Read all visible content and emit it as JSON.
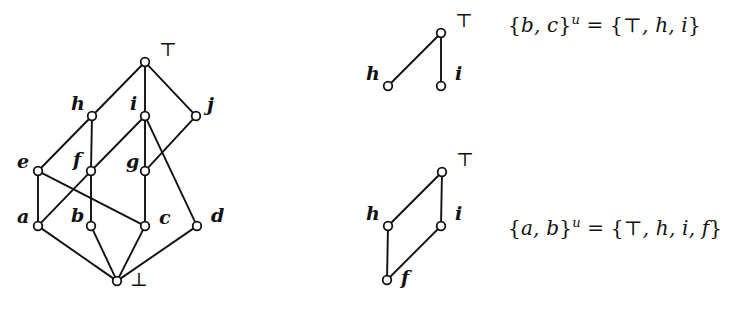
{
  "figure": {
    "background": "#ffffff",
    "ink": "#111111"
  },
  "main_lattice": {
    "name": "main-lattice",
    "nodes": [
      {
        "id": "top",
        "label": "⊤",
        "label_style": "upright",
        "x": 145,
        "y": 62,
        "lx": 159,
        "ly": 40
      },
      {
        "id": "h",
        "label": "h",
        "label_style": "italic",
        "x": 92,
        "y": 116,
        "lx": 71,
        "ly": 94
      },
      {
        "id": "i",
        "label": "i",
        "label_style": "italic",
        "x": 145,
        "y": 116,
        "lx": 130,
        "ly": 94
      },
      {
        "id": "j",
        "label": "j",
        "label_style": "italic",
        "x": 196,
        "y": 116,
        "lx": 207,
        "ly": 95
      },
      {
        "id": "e",
        "label": "e",
        "label_style": "italic",
        "x": 38,
        "y": 171,
        "lx": 17,
        "ly": 152
      },
      {
        "id": "f",
        "label": "f",
        "label_style": "italic",
        "x": 91,
        "y": 171,
        "lx": 73,
        "ly": 150
      },
      {
        "id": "g",
        "label": "g",
        "label_style": "italic",
        "x": 145,
        "y": 171,
        "lx": 126,
        "ly": 152
      },
      {
        "id": "a",
        "label": "a",
        "label_style": "italic",
        "x": 38,
        "y": 226,
        "lx": 17,
        "ly": 207
      },
      {
        "id": "b",
        "label": "b",
        "label_style": "italic",
        "x": 91,
        "y": 226,
        "lx": 71,
        "ly": 206
      },
      {
        "id": "c",
        "label": "c",
        "label_style": "italic",
        "x": 145,
        "y": 226,
        "lx": 159,
        "ly": 208
      },
      {
        "id": "d",
        "label": "d",
        "label_style": "italic",
        "x": 197,
        "y": 226,
        "lx": 211,
        "ly": 206
      },
      {
        "id": "bot",
        "label": "⊥",
        "label_style": "upright",
        "x": 117,
        "y": 281,
        "lx": 130,
        "ly": 270
      }
    ],
    "edges": [
      [
        "top",
        "h"
      ],
      [
        "top",
        "i"
      ],
      [
        "top",
        "j"
      ],
      [
        "h",
        "e"
      ],
      [
        "h",
        "f"
      ],
      [
        "i",
        "f"
      ],
      [
        "i",
        "g"
      ],
      [
        "i",
        "d"
      ],
      [
        "j",
        "g"
      ],
      [
        "e",
        "a"
      ],
      [
        "e",
        "c"
      ],
      [
        "f",
        "a"
      ],
      [
        "f",
        "b"
      ],
      [
        "g",
        "c"
      ],
      [
        "a",
        "bot"
      ],
      [
        "b",
        "bot"
      ],
      [
        "c",
        "bot"
      ],
      [
        "d",
        "bot"
      ]
    ]
  },
  "sub_lattice_1": {
    "name": "upper-bound-lattice-bc",
    "nodes": [
      {
        "id": "t1",
        "label": "⊤",
        "label_style": "upright",
        "x": 441,
        "y": 33,
        "lx": 455,
        "ly": 11
      },
      {
        "id": "h1",
        "label": "h",
        "label_style": "italic",
        "x": 388,
        "y": 86,
        "lx": 366,
        "ly": 64
      },
      {
        "id": "i1",
        "label": "i",
        "label_style": "italic",
        "x": 441,
        "y": 86,
        "lx": 455,
        "ly": 64
      }
    ],
    "edges": [
      [
        "t1",
        "h1"
      ],
      [
        "t1",
        "i1"
      ]
    ],
    "equation": {
      "set_open": "{",
      "members": "b, c",
      "set_close": "}",
      "superscript": "u",
      "equals": "=",
      "result_open": "{",
      "result_top": "⊤",
      "result_rest": ", h, i",
      "result_close": "}",
      "x": 508,
      "y": 12
    }
  },
  "sub_lattice_2": {
    "name": "upper-bound-lattice-ab",
    "nodes": [
      {
        "id": "t2",
        "label": "⊤",
        "label_style": "upright",
        "x": 442,
        "y": 172,
        "lx": 456,
        "ly": 150
      },
      {
        "id": "h2",
        "label": "h",
        "label_style": "italic",
        "x": 388,
        "y": 226,
        "lx": 366,
        "ly": 204
      },
      {
        "id": "i2",
        "label": "i",
        "label_style": "italic",
        "x": 441,
        "y": 226,
        "lx": 455,
        "ly": 204
      },
      {
        "id": "f2",
        "label": "f",
        "label_style": "italic",
        "x": 387,
        "y": 280,
        "lx": 401,
        "ly": 268
      }
    ],
    "edges": [
      [
        "t2",
        "h2"
      ],
      [
        "t2",
        "i2"
      ],
      [
        "h2",
        "f2"
      ],
      [
        "i2",
        "f2"
      ]
    ],
    "equation": {
      "set_open": "{",
      "members": "a, b",
      "set_close": "}",
      "superscript": "u",
      "equals": "=",
      "result_open": "{",
      "result_top": "⊤",
      "result_rest": ", h, i, f",
      "result_close": "}",
      "x": 508,
      "y": 215
    }
  }
}
